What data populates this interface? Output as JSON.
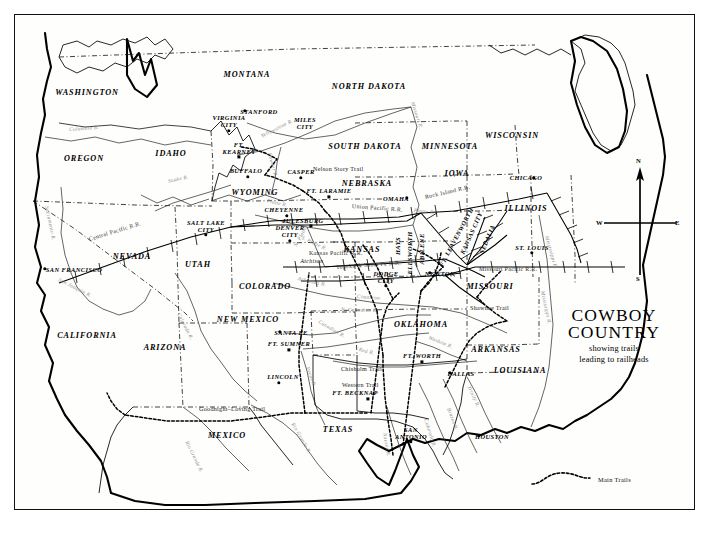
{
  "title_block": {
    "line1": "COWBOY",
    "line2": "COUNTRY",
    "subtitle1": "showing trails",
    "subtitle2": "leading to railheads"
  },
  "compass": {
    "north": "N",
    "south": "S",
    "east": "E",
    "west": "W"
  },
  "legend": {
    "label": "Main Trails",
    "symbol": "dashed-curve"
  },
  "states": [
    {
      "name": "WASHINGTON",
      "x": 86,
      "y": 91
    },
    {
      "name": "OREGON",
      "x": 83,
      "y": 157
    },
    {
      "name": "IDAHO",
      "x": 170,
      "y": 152
    },
    {
      "name": "MONTANA",
      "x": 246,
      "y": 73
    },
    {
      "name": "NORTH DAKOTA",
      "x": 368,
      "y": 85
    },
    {
      "name": "SOUTH DAKOTA",
      "x": 364,
      "y": 145
    },
    {
      "name": "MINNESOTA",
      "x": 449,
      "y": 145
    },
    {
      "name": "WISCONSIN",
      "x": 511,
      "y": 134
    },
    {
      "name": "IOWA",
      "x": 456,
      "y": 172
    },
    {
      "name": "NEBRASKA",
      "x": 366,
      "y": 182
    },
    {
      "name": "WYOMING",
      "x": 254,
      "y": 191
    },
    {
      "name": "ILLINOIS",
      "x": 525,
      "y": 207
    },
    {
      "name": "NEVADA",
      "x": 131,
      "y": 255
    },
    {
      "name": "UTAH",
      "x": 197,
      "y": 263
    },
    {
      "name": "COLORADO",
      "x": 264,
      "y": 285
    },
    {
      "name": "KANSAS",
      "x": 361,
      "y": 248
    },
    {
      "name": "MISSOURI",
      "x": 489,
      "y": 285
    },
    {
      "name": "CALIFORNIA",
      "x": 86,
      "y": 334
    },
    {
      "name": "ARIZONA",
      "x": 164,
      "y": 346
    },
    {
      "name": "NEW MEXICO",
      "x": 247,
      "y": 318
    },
    {
      "name": "OKLAHOMA",
      "x": 420,
      "y": 323
    },
    {
      "name": "ARKANSAS",
      "x": 495,
      "y": 348
    },
    {
      "name": "LOUISIANA",
      "x": 519,
      "y": 369
    },
    {
      "name": "TEXAS",
      "x": 337,
      "y": 428
    },
    {
      "name": "MEXICO",
      "x": 226,
      "y": 434
    }
  ],
  "cities": [
    {
      "name": "STANFORD",
      "x": 244,
      "y": 110,
      "dx": 14,
      "dy": 0,
      "marker": "dot"
    },
    {
      "name": "VIRGINIA CITY",
      "x": 228,
      "y": 130,
      "dx": 0,
      "dy": -9,
      "marker": "dot",
      "lines": [
        "VIRGINIA",
        "CITY"
      ]
    },
    {
      "name": "MILES CITY",
      "x": 304,
      "y": 131,
      "dx": 0,
      "dy": -8,
      "marker": "none",
      "lines": [
        "MILES",
        "CITY"
      ]
    },
    {
      "name": "FT. KEARNEY",
      "x": 238,
      "y": 156,
      "dx": 0,
      "dy": -8,
      "marker": "sq",
      "lines": [
        "FT.",
        "KEARNEY"
      ]
    },
    {
      "name": "BUFFALO",
      "x": 247,
      "y": 176,
      "dx": -2,
      "dy": -7,
      "marker": "dot"
    },
    {
      "name": "CASPER",
      "x": 300,
      "y": 177,
      "dx": 0,
      "dy": -7,
      "marker": "dot"
    },
    {
      "name": "CHICAGO",
      "x": 533,
      "y": 177,
      "dx": -8,
      "dy": -1,
      "marker": "dot"
    },
    {
      "name": "OMAHA",
      "x": 406,
      "y": 197,
      "dx": -11,
      "dy": 0,
      "marker": "dot"
    },
    {
      "name": "FT. LARAMIE",
      "x": 328,
      "y": 196,
      "dx": 0,
      "dy": -7,
      "marker": "sq"
    },
    {
      "name": "CHEYENNE",
      "x": 286,
      "y": 215,
      "dx": -3,
      "dy": -7,
      "marker": "dot"
    },
    {
      "name": "JULESBURG",
      "x": 310,
      "y": 225,
      "dx": -8,
      "dy": -6,
      "marker": "sq"
    },
    {
      "name": "SALT LAKE CITY",
      "x": 205,
      "y": 234,
      "dx": 0,
      "dy": -8,
      "marker": "dot",
      "lines": [
        "SALT LAKE",
        "CITY"
      ]
    },
    {
      "name": "DENVER CITY",
      "x": 289,
      "y": 240,
      "dx": 0,
      "dy": -9,
      "marker": "dot",
      "lines": [
        "DENVER",
        "CITY"
      ]
    },
    {
      "name": "ST. LOUIS",
      "x": 531,
      "y": 252,
      "dx": 0,
      "dy": -6,
      "marker": "dot"
    },
    {
      "name": "SAN FRANCISCO",
      "x": 44,
      "y": 268,
      "dx": 29,
      "dy": 0,
      "marker": "dot"
    },
    {
      "name": "NEWTON",
      "x": 429,
      "y": 272,
      "dx": 10,
      "dy": 0,
      "marker": "dot"
    },
    {
      "name": "DODGE CITY",
      "x": 385,
      "y": 285,
      "dx": 0,
      "dy": -8,
      "marker": "dot",
      "lines": [
        "DODGE",
        "CITY"
      ]
    },
    {
      "name": "SANTA FE",
      "x": 279,
      "y": 331,
      "dx": 11,
      "dy": 0,
      "marker": "dot"
    },
    {
      "name": "FT. WORTH",
      "x": 421,
      "y": 361,
      "dx": 0,
      "dy": -7,
      "marker": "sq"
    },
    {
      "name": "DALLAS",
      "x": 449,
      "y": 372,
      "dx": 11,
      "dy": 0,
      "marker": "dot"
    },
    {
      "name": "FT. SUMNER",
      "x": 288,
      "y": 349,
      "dx": 0,
      "dy": -7,
      "marker": "sq"
    },
    {
      "name": "LINCOLN",
      "x": 278,
      "y": 382,
      "dx": 4,
      "dy": -7,
      "marker": "dot"
    },
    {
      "name": "FT. BECKNAP",
      "x": 367,
      "y": 398,
      "dx": -13,
      "dy": -7,
      "marker": "sq"
    },
    {
      "name": "SAN ANTONIO",
      "x": 410,
      "y": 441,
      "dx": 0,
      "dy": -8,
      "marker": "dot",
      "lines": [
        "SAN",
        "ANTONIO"
      ]
    },
    {
      "name": "HOUSTON",
      "x": 478,
      "y": 435,
      "dx": 13,
      "dy": 0,
      "marker": "dot"
    },
    {
      "name": "Atchison",
      "x": 313,
      "y": 265,
      "dx": -2,
      "dy": -5,
      "marker": "none",
      "small": true
    }
  ],
  "rotated_cities": [
    {
      "name": "HAYS",
      "x": 396,
      "y": 245,
      "rot": -90
    },
    {
      "name": "ELLSWORTH",
      "x": 408,
      "y": 252,
      "rot": -90
    },
    {
      "name": "ABILENE",
      "x": 420,
      "y": 248,
      "rot": -90
    },
    {
      "name": "FT. LEAVENWORTH",
      "x": 455,
      "y": 236,
      "rot": -62
    },
    {
      "name": "KANSAS CITY",
      "x": 470,
      "y": 232,
      "rot": -66
    },
    {
      "name": "SEDALIA",
      "x": 486,
      "y": 238,
      "rot": -68
    }
  ],
  "railroads": [
    {
      "name": "Central Pacific R.R.",
      "x": 88,
      "y": 238,
      "rot": -17
    },
    {
      "name": "Union Pacific R.R.",
      "x": 351,
      "y": 205,
      "rot": 4
    },
    {
      "name": "Kansas Pacific R.R.",
      "x": 308,
      "y": 252,
      "rot": 0
    },
    {
      "name": "Topeka & Santa Fe R.R.",
      "x": 335,
      "y": 266,
      "rot": -4
    },
    {
      "name": "Rock Island R.R.",
      "x": 424,
      "y": 196,
      "rot": -13
    },
    {
      "name": "Missouri Pacific R.R.",
      "x": 478,
      "y": 268,
      "rot": 0
    }
  ],
  "rivers": [
    {
      "name": "Columbia R.",
      "x": 68,
      "y": 128,
      "rot": -4
    },
    {
      "name": "Snake R.",
      "x": 167,
      "y": 180,
      "rot": -13
    },
    {
      "name": "Yellowstone R.",
      "x": 260,
      "y": 135,
      "rot": -27
    },
    {
      "name": "Powder R.",
      "x": 269,
      "y": 152,
      "rot": 75
    },
    {
      "name": "Missouri R.",
      "x": 412,
      "y": 101,
      "rot": 72
    },
    {
      "name": "Sacramento R.",
      "x": 46,
      "y": 205,
      "rot": 78
    },
    {
      "name": "San Joaquin R.",
      "x": 58,
      "y": 278,
      "rot": 27
    },
    {
      "name": "Colorado R.",
      "x": 178,
      "y": 312,
      "rot": 63
    },
    {
      "name": "Platte R.",
      "x": 266,
      "y": 199,
      "rot": 14
    },
    {
      "name": "N. Platte R.",
      "x": 294,
      "y": 245,
      "rot": -62
    },
    {
      "name": "Platte R.",
      "x": 413,
      "y": 209,
      "rot": 6
    },
    {
      "name": "S. Platte R.",
      "x": 301,
      "y": 236,
      "rot": 25
    },
    {
      "name": "Arkansas R.",
      "x": 297,
      "y": 277,
      "rot": 13
    },
    {
      "name": "Cimarron",
      "x": 356,
      "y": 295,
      "rot": 4
    },
    {
      "name": "N. Canadian R.",
      "x": 340,
      "y": 308,
      "rot": 2
    },
    {
      "name": "Canadian R.",
      "x": 318,
      "y": 320,
      "rot": 30
    },
    {
      "name": "Red R.",
      "x": 358,
      "y": 348,
      "rot": 14
    },
    {
      "name": "Washita R.",
      "x": 428,
      "y": 336,
      "rot": 22
    },
    {
      "name": "Pecos R.",
      "x": 307,
      "y": 366,
      "rot": 70
    },
    {
      "name": "Rio Grande R.",
      "x": 292,
      "y": 422,
      "rot": 60
    },
    {
      "name": "Rio Grande R.",
      "x": 186,
      "y": 440,
      "rot": 64
    },
    {
      "name": "Brazos R.",
      "x": 448,
      "y": 407,
      "rot": 70
    },
    {
      "name": "Colorado R.",
      "x": 425,
      "y": 418,
      "rot": 72
    },
    {
      "name": "Nueces R.",
      "x": 384,
      "y": 432,
      "rot": 80
    },
    {
      "name": "Trinity R.",
      "x": 468,
      "y": 385,
      "rot": 64
    },
    {
      "name": "Mississippi R.",
      "x": 542,
      "y": 290,
      "rot": 78
    },
    {
      "name": "Mississippi R.",
      "x": 546,
      "y": 235,
      "rot": 74
    }
  ],
  "trails": [
    {
      "name": "Nelson Story Trail",
      "x": 312,
      "y": 168,
      "rot": 0
    },
    {
      "name": "Chisholm Trail",
      "x": 340,
      "y": 368,
      "rot": 0
    },
    {
      "name": "Western Trail",
      "x": 341,
      "y": 384,
      "rot": 0
    },
    {
      "name": "Goodnight–Loving Trail",
      "x": 198,
      "y": 408,
      "rot": 0
    },
    {
      "name": "Shawnee Trail",
      "x": 469,
      "y": 307,
      "rot": 0
    }
  ]
}
